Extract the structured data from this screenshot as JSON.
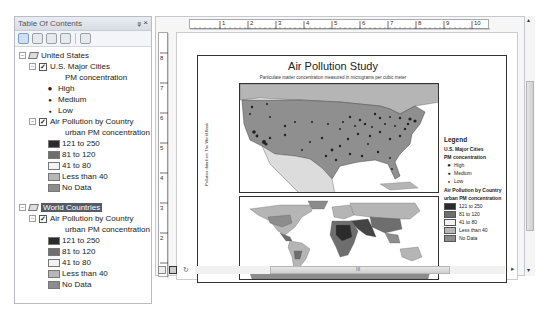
{
  "toc": {
    "title": "Table Of Contents",
    "controls": {
      "pin": "ᵩ",
      "close": "×"
    },
    "tools": [
      "list-by-drawing-order",
      "list-by-source",
      "list-by-visibility",
      "list-by-selection",
      "options"
    ],
    "groups": [
      {
        "name": "United States",
        "selected": false,
        "layers": [
          {
            "name": "U.S. Major Cities",
            "checked": true,
            "field": "PM concentration",
            "classes": [
              {
                "label": "High",
                "symbol": "●"
              },
              {
                "label": "Medium",
                "symbol": "•"
              },
              {
                "label": "Low",
                "symbol": "·"
              }
            ]
          },
          {
            "name": "Air Pollution by Country",
            "checked": true,
            "field": "urban PM concentration",
            "classes": [
              {
                "label": "121 to 250",
                "color": "#2b2b2b"
              },
              {
                "label": "81 to 120",
                "color": "#6e6e6e"
              },
              {
                "label": "41 to 80",
                "color": "#f2f2f2"
              },
              {
                "label": "Less than 40",
                "color": "#b7b7b7"
              },
              {
                "label": "No Data",
                "color": "#8c8c8c"
              }
            ]
          }
        ]
      },
      {
        "name": "World Countries",
        "selected": true,
        "layers": [
          {
            "name": "Air Pollution by Country",
            "checked": true,
            "field": "urban PM concentration",
            "classes": [
              {
                "label": "121 to 250",
                "color": "#2b2b2b"
              },
              {
                "label": "81 to 120",
                "color": "#6e6e6e"
              },
              {
                "label": "41 to 80",
                "color": "#f2f2f2"
              },
              {
                "label": "Less than 40",
                "color": "#b7b7b7"
              },
              {
                "label": "No Data",
                "color": "#8c8c8c"
              }
            ]
          }
        ]
      }
    ]
  },
  "layout": {
    "hruler_ticks": [
      "1",
      "2",
      "3",
      "4",
      "5",
      "6",
      "7",
      "8",
      "9",
      "10"
    ],
    "vruler_ticks": [
      "8",
      "7",
      "6",
      "5",
      "4",
      "3",
      "2",
      "1"
    ],
    "map_title": "Air Pollution Study",
    "map_subtitle": "Particulate matter concentration measured in micrograms per cubic meter",
    "credit": "Pollution data from The World Bank",
    "legend": {
      "title": "Legend",
      "cities_layer": "U.S. Major Cities",
      "cities_field": "PM concentration",
      "cities_classes": [
        "High",
        "Medium",
        "Low"
      ],
      "country_layer": "Air Pollution by Country",
      "country_field": "urban PM concentration",
      "country_classes": [
        "121 to 250",
        "81 to 120",
        "41 to 80",
        "Less than 40",
        "No Data"
      ]
    }
  },
  "bottombar": {
    "buttons": [
      "data-view",
      "layout-view",
      "refresh",
      "pause"
    ],
    "scroll_grip": "III"
  }
}
